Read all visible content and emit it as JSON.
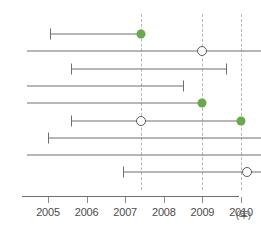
{
  "chart_data": {
    "type": "range",
    "title": "",
    "xlabel": "年",
    "ylabel": "",
    "xlim": [
      2004.4,
      2010.7
    ],
    "grid": true,
    "legend": null,
    "axis": {
      "unit_label": "(年)",
      "ticks": [
        {
          "value": 2005,
          "label": "2005"
        },
        {
          "value": 2006,
          "label": "2006"
        },
        {
          "value": 2007,
          "label": "2007"
        },
        {
          "value": 2008,
          "label": "2008"
        },
        {
          "value": 2009,
          "label": "2009"
        },
        {
          "value": 2010,
          "label": "2010"
        }
      ]
    },
    "gridlines": [
      2007.4,
      2009.0,
      2010.0
    ],
    "colors": {
      "marker_filled": "#6aa84f",
      "marker_open_stroke": "#5c5c5c",
      "line": "#6f6f6f",
      "gridline": "#b9b9b9",
      "background": "#ffffff"
    },
    "series": [
      {
        "name": "row-1",
        "start": 2005.05,
        "end": 2007.4,
        "start_capped": true,
        "end_capped": false,
        "markers": [
          {
            "value": 2007.4,
            "style": "filled"
          }
        ]
      },
      {
        "name": "row-2",
        "start": 2004.45,
        "end": 2010.65,
        "start_capped": false,
        "end_capped": false,
        "markers": [
          {
            "value": 2009.0,
            "style": "open"
          }
        ]
      },
      {
        "name": "row-3",
        "start": 2005.6,
        "end": 2009.6,
        "start_capped": true,
        "end_capped": true,
        "markers": []
      },
      {
        "name": "row-4",
        "start": 2004.45,
        "end": 2008.5,
        "start_capped": false,
        "end_capped": true,
        "markers": []
      },
      {
        "name": "row-5",
        "start": 2004.45,
        "end": 2009.0,
        "start_capped": false,
        "end_capped": false,
        "markers": [
          {
            "value": 2009.0,
            "style": "filled"
          }
        ]
      },
      {
        "name": "row-6",
        "start": 2005.6,
        "end": 2010.0,
        "start_capped": true,
        "end_capped": false,
        "markers": [
          {
            "value": 2007.4,
            "style": "open"
          },
          {
            "value": 2010.0,
            "style": "filled"
          }
        ]
      },
      {
        "name": "row-7",
        "start": 2005.0,
        "end": 2010.65,
        "start_capped": true,
        "end_capped": false,
        "markers": []
      },
      {
        "name": "row-8",
        "start": 2004.45,
        "end": 2010.65,
        "start_capped": false,
        "end_capped": false,
        "markers": []
      },
      {
        "name": "row-9",
        "start": 2006.95,
        "end": 2010.55,
        "start_capped": true,
        "end_capped": false,
        "markers": [
          {
            "value": 2010.15,
            "style": "open"
          }
        ]
      }
    ]
  }
}
